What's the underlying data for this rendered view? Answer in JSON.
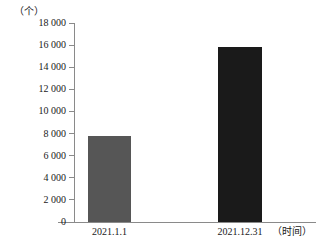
{
  "chart_data": {
    "type": "bar",
    "title": "",
    "subtitle": "",
    "unit_label": "（个）",
    "xlabel": "（时间）",
    "ylabel": "",
    "categories": [
      "2021.1.1",
      "2021.12.31"
    ],
    "values": [
      7800,
      15800
    ],
    "series": [
      {
        "name": "数量",
        "values": [
          7800,
          15800
        ]
      }
    ],
    "ylim": [
      0,
      18000
    ],
    "y_ticks": [
      0,
      2000,
      4000,
      6000,
      8000,
      10000,
      12000,
      14000,
      16000,
      18000
    ],
    "y_tick_labels": [
      "0",
      "2 000",
      "4 000",
      "6 000",
      "8 000",
      "10 000",
      "12 000",
      "14 000",
      "16 000",
      "18 000"
    ],
    "grid": false,
    "legend": false,
    "legend_position": "none",
    "bar_colors": [
      "#565656",
      "#1a1a1a"
    ],
    "axis_color": "#8a8a8a",
    "background_color": "#ffffff"
  }
}
